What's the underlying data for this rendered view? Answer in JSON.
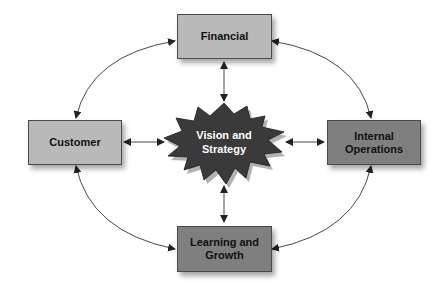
{
  "diagram": {
    "center": {
      "label_line1": "Vision and",
      "label_line2": "Strategy",
      "shape": "starburst",
      "fill": "#3a3a3a"
    },
    "nodes": {
      "financial": {
        "label": "Financial",
        "fill": "#b9b9b9"
      },
      "customer": {
        "label": "Customer",
        "fill": "#b9b9b9"
      },
      "internal": {
        "label_line1": "Internal",
        "label_line2": "Operations",
        "fill": "#7f7f7f"
      },
      "learning": {
        "label_line1": "Learning and",
        "label_line2": "Growth",
        "fill": "#7f7f7f"
      }
    },
    "edges": [
      {
        "from": "center",
        "to": "financial",
        "type": "bidirectional-straight"
      },
      {
        "from": "center",
        "to": "customer",
        "type": "bidirectional-straight"
      },
      {
        "from": "center",
        "to": "internal",
        "type": "bidirectional-straight"
      },
      {
        "from": "center",
        "to": "learning",
        "type": "bidirectional-straight"
      },
      {
        "from": "financial",
        "to": "customer",
        "type": "bidirectional-arc"
      },
      {
        "from": "financial",
        "to": "internal",
        "type": "bidirectional-arc"
      },
      {
        "from": "customer",
        "to": "learning",
        "type": "bidirectional-arc"
      },
      {
        "from": "internal",
        "to": "learning",
        "type": "bidirectional-arc"
      }
    ]
  }
}
